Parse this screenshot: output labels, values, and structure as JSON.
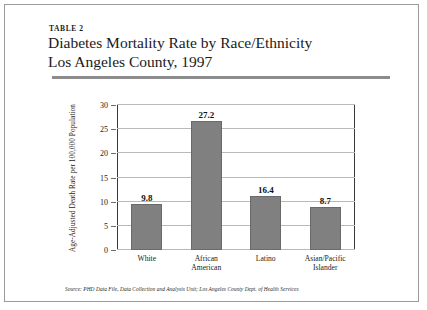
{
  "figure": {
    "table_label": "TABLE 2",
    "title_line1": "Diabetes Mortality Rate by Race/Ethnicity",
    "title_line2": "Los Angeles County, 1997",
    "source_note": "Source: PHD Data File, Data Collection and Analysis Unit; Los Angeles County Dept. of Health Services"
  },
  "chart_data": {
    "type": "bar",
    "title": "Diabetes Mortality Rate by Race/Ethnicity Los Angeles County, 1997",
    "categories": [
      "White",
      "African\nAmerican",
      "Latino",
      "Asian/Pacific\nIslander"
    ],
    "values": [
      9.8,
      27.2,
      16.4,
      8.7
    ],
    "value_labels": [
      "9.8",
      "27.2",
      "16.4",
      "8.7"
    ],
    "bar_heights": [
      9.6,
      26.6,
      11.1,
      8.8
    ],
    "xlabel": "",
    "ylabel": "Age-Adjusted Death Rate per 100,000 Population",
    "ylim": [
      0,
      30
    ],
    "yticks": [
      0,
      5,
      10,
      15,
      20,
      25,
      30
    ],
    "ytick_labels": [
      "0",
      "5",
      "10",
      "15",
      "20",
      "25",
      "30"
    ],
    "grid": true,
    "legend": "none",
    "bar_color": "#808080",
    "grid_color": "#b9b9b9",
    "axis_color": "#3a3a3a"
  }
}
